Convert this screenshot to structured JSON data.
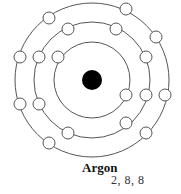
{
  "diagram": {
    "element_name": "Argon",
    "electron_configuration": "2, 8, 8",
    "nucleus": {
      "cx": 92,
      "cy": 80,
      "r": 10,
      "color": "#000000"
    },
    "shells": [
      {
        "r": 38,
        "electrons": [
          [
            58,
            57
          ],
          [
            126,
            95
          ]
        ]
      },
      {
        "r": 58,
        "electrons": [
          [
            68,
            29
          ],
          [
            116,
            29
          ],
          [
            39,
            57
          ],
          [
            146,
            57
          ],
          [
            39,
            104
          ],
          [
            146,
            95
          ],
          [
            68,
            133
          ],
          [
            126,
            123
          ]
        ]
      },
      {
        "r": 77,
        "electrons": [
          [
            49,
            18
          ],
          [
            126,
            9
          ],
          [
            156,
            37
          ],
          [
            20,
            57
          ],
          [
            20,
            104
          ],
          [
            165,
            95
          ],
          [
            49,
            143
          ],
          [
            146,
            133
          ]
        ]
      }
    ],
    "electron_radius": 6,
    "line_color": "#555555"
  }
}
